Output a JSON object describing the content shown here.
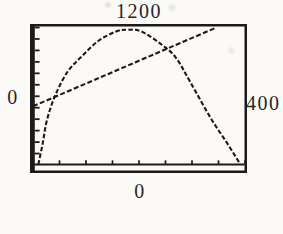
{
  "figure": {
    "type": "graphing-calculator-screen",
    "labels": {
      "top_ymax": "1200",
      "left_xmin": "0",
      "right_xmax": "400",
      "bottom_ymin": "0"
    }
  },
  "chart_data": {
    "type": "line",
    "title": "",
    "xlabel": "",
    "ylabel": "",
    "window": {
      "xlim": [
        0,
        400
      ],
      "ylim": [
        0,
        1200
      ],
      "xscl": 50,
      "yscl": 100
    },
    "grid": false,
    "legend": null,
    "axis_edge_labels": {
      "top": "1200",
      "left": "0",
      "right": "400",
      "bottom": "0"
    },
    "series": [
      {
        "name": "concave-curve",
        "style": "dashed-pixel",
        "points": [
          [
            10,
            5
          ],
          [
            18,
            180
          ],
          [
            26,
            386
          ],
          [
            41,
            596
          ],
          [
            64,
            806
          ],
          [
            92,
            948
          ],
          [
            123,
            1082
          ],
          [
            157,
            1166
          ],
          [
            179,
            1180
          ],
          [
            204,
            1166
          ],
          [
            241,
            1057
          ],
          [
            269,
            940
          ],
          [
            297,
            722
          ],
          [
            335,
            411
          ],
          [
            366,
            193
          ],
          [
            390,
            15
          ]
        ]
      },
      {
        "name": "straight-line",
        "style": "dashed-pixel",
        "points": [
          [
            0,
            512
          ],
          [
            346,
            1200
          ]
        ]
      }
    ],
    "intersections": [
      [
        41,
        600
      ],
      [
        258,
        1030
      ]
    ]
  },
  "colors": {
    "ink": "#1d1b18",
    "paper": "#fbfaf7"
  }
}
